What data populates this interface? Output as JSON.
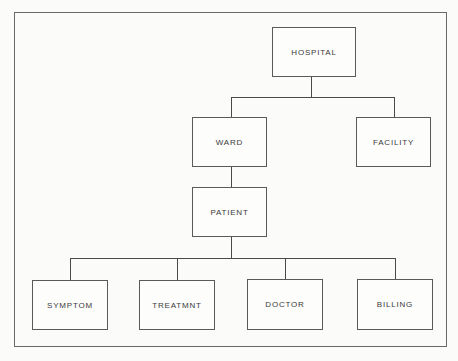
{
  "diagram": {
    "type": "hierarchy",
    "nodes": {
      "hospital": {
        "label": "HOSPITAL"
      },
      "ward": {
        "label": "WARD"
      },
      "facility": {
        "label": "FACILITY"
      },
      "patient": {
        "label": "PATIENT"
      },
      "symptom": {
        "label": "SYMPTOM"
      },
      "treatmnt": {
        "label": "TREATMNT"
      },
      "doctor": {
        "label": "DOCTOR"
      },
      "billing": {
        "label": "BILLING"
      }
    },
    "edges": [
      [
        "HOSPITAL",
        "WARD"
      ],
      [
        "HOSPITAL",
        "FACILITY"
      ],
      [
        "WARD",
        "PATIENT"
      ],
      [
        "PATIENT",
        "SYMPTOM"
      ],
      [
        "PATIENT",
        "TREATMNT"
      ],
      [
        "PATIENT",
        "DOCTOR"
      ],
      [
        "PATIENT",
        "BILLING"
      ]
    ]
  }
}
